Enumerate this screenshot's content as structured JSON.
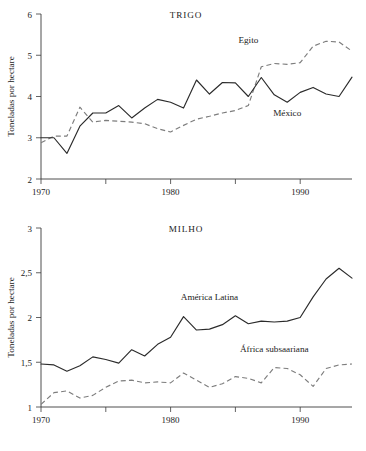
{
  "figure": {
    "background": "#ffffff",
    "text_color": "#222222",
    "solid_color": "#2b2b2b",
    "dashed_color": "#7d7d7d"
  },
  "chart_data": [
    {
      "type": "line",
      "title": "TRIGO",
      "xlabel": "",
      "ylabel": "Toneladas por hectare",
      "xlim": [
        1970,
        1994
      ],
      "ylim": [
        2,
        6
      ],
      "grid": false,
      "legend_position": "inline-annotations",
      "xticks": [
        1970,
        1975,
        1980,
        1985,
        1990
      ],
      "xticklabels": [
        "1970",
        "",
        "1980",
        "",
        "1990"
      ],
      "yticks": [
        2,
        3,
        4,
        5,
        6
      ],
      "yticklabels": [
        "2",
        "3",
        "4",
        "5",
        "6"
      ],
      "x": [
        1970,
        1971,
        1972,
        1973,
        1974,
        1975,
        1976,
        1977,
        1978,
        1979,
        1980,
        1981,
        1982,
        1983,
        1984,
        1985,
        1986,
        1987,
        1988,
        1989,
        1990,
        1991,
        1992,
        1993,
        1994
      ],
      "series": [
        {
          "name": "México",
          "style": "solid",
          "values": [
            3.0,
            3.0,
            2.62,
            3.28,
            3.6,
            3.6,
            3.78,
            3.48,
            3.72,
            3.93,
            3.86,
            3.72,
            4.4,
            4.06,
            4.34,
            4.33,
            4.0,
            4.46,
            4.04,
            3.86,
            4.1,
            4.22,
            4.06,
            4.0,
            4.47
          ]
        },
        {
          "name": "Egito",
          "style": "dashed",
          "values": [
            2.88,
            3.04,
            3.04,
            3.74,
            3.38,
            3.42,
            3.4,
            3.38,
            3.34,
            3.22,
            3.14,
            3.3,
            3.45,
            3.52,
            3.6,
            3.66,
            3.78,
            4.72,
            4.8,
            4.78,
            4.82,
            5.22,
            5.34,
            5.32,
            5.1
          ]
        }
      ],
      "annotations": [
        {
          "text": "Egito",
          "x": 1986,
          "y": 5.3
        },
        {
          "text": "México",
          "x": 1989,
          "y": 3.52
        }
      ]
    },
    {
      "type": "line",
      "title": "MILHO",
      "xlabel": "",
      "ylabel": "Toneladas por hectare",
      "xlim": [
        1970,
        1994
      ],
      "ylim": [
        1,
        3
      ],
      "grid": false,
      "legend_position": "inline-annotations",
      "xticks": [
        1970,
        1975,
        1980,
        1985,
        1990
      ],
      "xticklabels": [
        "1970",
        "",
        "1980",
        "",
        "1990"
      ],
      "yticks": [
        1,
        1.5,
        2,
        2.5,
        3
      ],
      "yticklabels": [
        "1",
        "1,5",
        "2",
        "2,5",
        "3"
      ],
      "x": [
        1970,
        1971,
        1972,
        1973,
        1974,
        1975,
        1976,
        1977,
        1978,
        1979,
        1980,
        1981,
        1982,
        1983,
        1984,
        1985,
        1986,
        1987,
        1988,
        1989,
        1990,
        1991,
        1992,
        1993,
        1994
      ],
      "series": [
        {
          "name": "América Latina",
          "style": "solid",
          "values": [
            1.48,
            1.47,
            1.4,
            1.46,
            1.56,
            1.53,
            1.49,
            1.64,
            1.57,
            1.7,
            1.78,
            2.01,
            1.86,
            1.87,
            1.92,
            2.02,
            1.93,
            1.96,
            1.95,
            1.96,
            2.0,
            2.23,
            2.43,
            2.55,
            2.44
          ]
        },
        {
          "name": "África subsaariana",
          "style": "dashed",
          "values": [
            1.03,
            1.16,
            1.18,
            1.1,
            1.13,
            1.22,
            1.29,
            1.3,
            1.27,
            1.28,
            1.27,
            1.38,
            1.3,
            1.22,
            1.26,
            1.34,
            1.32,
            1.27,
            1.44,
            1.43,
            1.36,
            1.23,
            1.43,
            1.47,
            1.48
          ]
        }
      ],
      "annotations": [
        {
          "text": "América Latina",
          "x": 1983,
          "y": 2.2
        },
        {
          "text": "África subsaariana",
          "x": 1988,
          "y": 1.62
        }
      ]
    }
  ]
}
